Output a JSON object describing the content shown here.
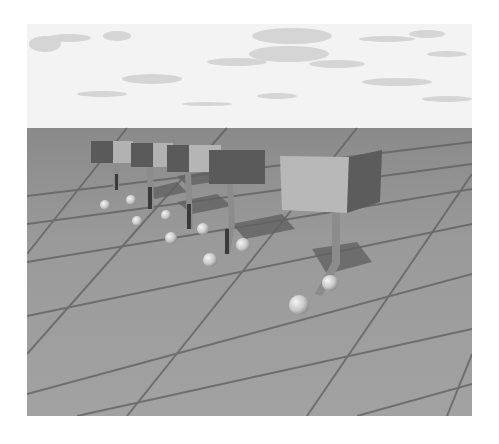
{
  "scene": {
    "description": "Grayscale 3D render: four box-shaped signs on bent posts with spheres on a tiled floor under a cloudy sky",
    "colors": {
      "sky": "#f3f3f3",
      "cloud": "#d2d2d2",
      "ground": "#979797",
      "grid_line": "#5e5e5e",
      "box_light": "#b2b2b2",
      "box_dark": "#5a5a5a",
      "post": "#8c8c8c",
      "shadow": "#626262",
      "sphere": "#d8d8d8"
    },
    "boxes": [
      {
        "x": 64,
        "y": 117,
        "w": 42,
        "h": 22,
        "dark_w": 20
      },
      {
        "x": 90,
        "y": 119,
        "w": 46,
        "h": 23,
        "dark_w": 20
      },
      {
        "x": 125,
        "y": 121,
        "w": 55,
        "h": 26,
        "dark_w": 22
      },
      {
        "x": 160,
        "y": 125,
        "w": 78,
        "h": 36,
        "dark_w": 40
      },
      {
        "x": 253,
        "y": 130,
        "w": 100,
        "h": 55,
        "dark_w": 36
      }
    ],
    "spheres": [
      {
        "cx": 78,
        "cy": 181,
        "r": 5
      },
      {
        "cx": 104,
        "cy": 176,
        "r": 5
      },
      {
        "cx": 110,
        "cy": 197,
        "r": 5
      },
      {
        "cx": 139,
        "cy": 191,
        "r": 5
      },
      {
        "cx": 144,
        "cy": 214,
        "r": 6
      },
      {
        "cx": 176,
        "cy": 205,
        "r": 6
      },
      {
        "cx": 183,
        "cy": 236,
        "r": 7
      },
      {
        "cx": 216,
        "cy": 221,
        "r": 7
      },
      {
        "cx": 303,
        "cy": 259,
        "r": 8
      },
      {
        "cx": 272,
        "cy": 281,
        "r": 10
      }
    ]
  }
}
